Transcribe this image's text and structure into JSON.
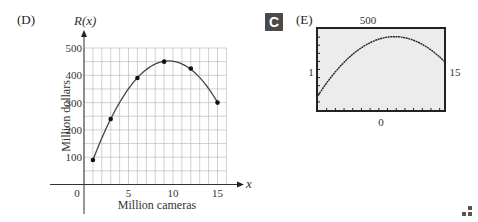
{
  "panel_d": {
    "label": "(D)"
  },
  "panel_e": {
    "badge": "C",
    "label": "(E)",
    "ymax_label": "500",
    "ymin_label": "0",
    "xmin_label": "1",
    "xmax_label": "15"
  },
  "chart_data": [
    {
      "type": "scatter",
      "title": "",
      "ylabel_top": "R(x)",
      "ylabel": "Million dollars",
      "xlabel": "Million cameras",
      "xaxis_letter": "x",
      "xlim": [
        0,
        16
      ],
      "ylim": [
        0,
        500
      ],
      "x_ticks": [
        0,
        5,
        10,
        15
      ],
      "x_tick_labels": [
        "0",
        "5",
        "10",
        "15"
      ],
      "y_ticks": [
        100,
        200,
        300,
        400,
        500
      ],
      "y_tick_labels": [
        "100",
        "200",
        "300",
        "400",
        "500"
      ],
      "grid": true,
      "points": [
        {
          "x": 1,
          "y": 90
        },
        {
          "x": 3,
          "y": 240
        },
        {
          "x": 6,
          "y": 390
        },
        {
          "x": 9,
          "y": 450
        },
        {
          "x": 12,
          "y": 425
        },
        {
          "x": 15,
          "y": 300
        }
      ],
      "curve": {
        "type": "quadratic-fit",
        "x_range": [
          1,
          15
        ]
      }
    },
    {
      "type": "line",
      "title": "",
      "window": {
        "xmin": 1,
        "xmax": 15,
        "ymin": 0,
        "ymax": 500
      },
      "description": "graphing calculator view of quadratic regression",
      "grid": false
    }
  ]
}
